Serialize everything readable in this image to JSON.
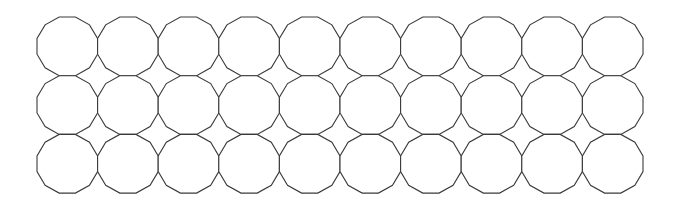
{
  "diagram": {
    "type": "tiling",
    "shape": "dodecagon",
    "sides": 12,
    "rows": 3,
    "columns": 10,
    "cell_count": 30,
    "origin": {
      "x": 37,
      "y": 17
    },
    "pitch": {
      "x": 60.6,
      "y": 58.7
    },
    "stroke_color": "#3a3a3a",
    "fill_color": "#ffffff",
    "background_color": "#ffffff"
  }
}
